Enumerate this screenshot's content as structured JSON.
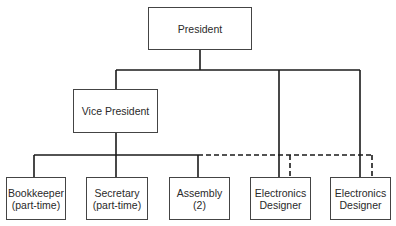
{
  "chart": {
    "nodes": {
      "president": {
        "line1": "President"
      },
      "vice_president": {
        "line1": "Vice President"
      },
      "bookkeeper": {
        "line1": "Bookkeeper",
        "line2": "(part-time)"
      },
      "secretary": {
        "line1": "Secretary",
        "line2": "(part-time)"
      },
      "assembly": {
        "line1": "Assembly",
        "line2": "(2)"
      },
      "electronics_designer_1": {
        "line1": "Electronics",
        "line2": "Designer"
      },
      "electronics_designer_2": {
        "line1": "Electronics",
        "line2": "Designer"
      }
    },
    "edges": [
      {
        "from": "president",
        "to": "vice_president",
        "style": "solid"
      },
      {
        "from": "president",
        "to": "electronics_designer_1",
        "style": "solid"
      },
      {
        "from": "president",
        "to": "electronics_designer_2",
        "style": "solid"
      },
      {
        "from": "vice_president",
        "to": "bookkeeper",
        "style": "solid"
      },
      {
        "from": "vice_president",
        "to": "secretary",
        "style": "solid"
      },
      {
        "from": "vice_president",
        "to": "assembly",
        "style": "solid"
      },
      {
        "from": "vice_president",
        "to": "electronics_designer_1",
        "style": "dashed"
      },
      {
        "from": "vice_president",
        "to": "electronics_designer_2",
        "style": "dashed"
      }
    ],
    "line_color": "#1a1a1a"
  }
}
